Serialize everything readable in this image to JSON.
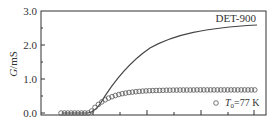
{
  "chart_data": {
    "type": "line",
    "title": "",
    "xlabel": "",
    "ylabel": "G/mS",
    "ylim": [
      0.0,
      3.0
    ],
    "yticks": [
      "0.0",
      "1.0",
      "2.0",
      "3.0"
    ],
    "grid": false,
    "series": [
      {
        "name": "DET-900",
        "style": "solid line",
        "x": [
          0,
          1,
          2,
          3,
          4,
          5,
          6,
          7,
          8
        ],
        "values": [
          0.0,
          0.0,
          0.9,
          1.7,
          2.15,
          2.38,
          2.5,
          2.56,
          2.6
        ]
      },
      {
        "name": "T0=77 K",
        "style": "open circles",
        "x": [
          0,
          1,
          2,
          3,
          4,
          5,
          6,
          7,
          8
        ],
        "values": [
          0.0,
          0.0,
          0.45,
          0.6,
          0.64,
          0.66,
          0.67,
          0.68,
          0.68
        ]
      }
    ],
    "annotations": [
      "DET-900",
      "T0=77 K"
    ]
  },
  "labels": {
    "ylabel_italic": "G",
    "ylabel_unit": "/mS",
    "series_label": "DET-900",
    "legend_T": "T",
    "legend_sub": "0",
    "legend_rest": "=77 K",
    "ytick_0": "0.0",
    "ytick_1": "1.0",
    "ytick_2": "2.0",
    "ytick_3": "3.0"
  }
}
